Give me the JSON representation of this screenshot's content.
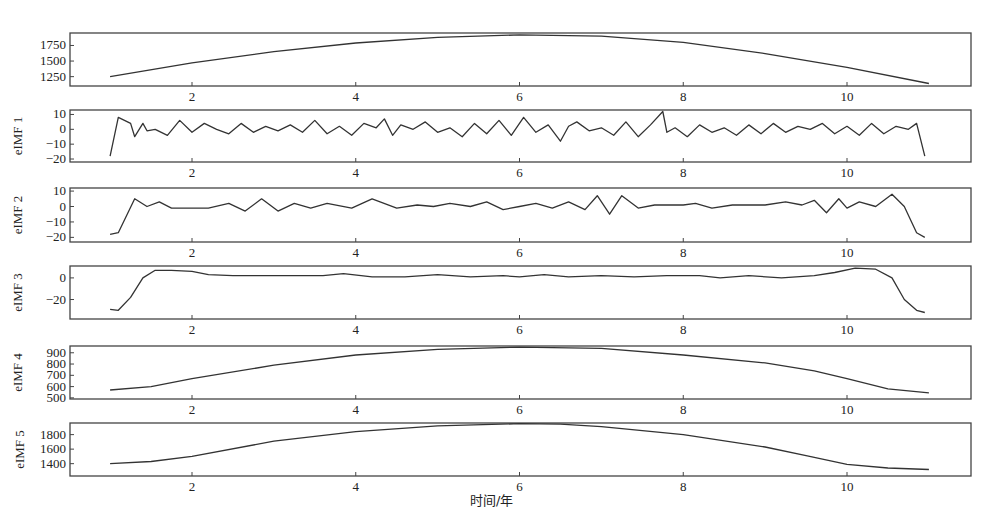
{
  "figure": {
    "xlabel": "时间/年",
    "line_color": "#333333",
    "frame_color": "#444444"
  },
  "chart_data": [
    {
      "type": "line",
      "panel": 0,
      "ylabel": "",
      "xlim": [
        0.3,
        11.5
      ],
      "ylim": [
        1100,
        1950
      ],
      "xticks": [
        2,
        4,
        6,
        8,
        10
      ],
      "yticks": [
        1250,
        1500,
        1750
      ],
      "x": [
        1.0,
        2.0,
        3.0,
        4.0,
        5.0,
        6.0,
        7.0,
        8.0,
        9.0,
        10.0,
        11.0
      ],
      "values": [
        1250,
        1470,
        1650,
        1790,
        1880,
        1920,
        1900,
        1800,
        1620,
        1400,
        1140
      ]
    },
    {
      "type": "line",
      "panel": 1,
      "ylabel": "eIMF 1",
      "xlim": [
        0.3,
        11.5
      ],
      "ylim": [
        -22,
        13
      ],
      "xticks": [
        2,
        4,
        6,
        8,
        10
      ],
      "yticks": [
        -20,
        -10,
        0,
        10
      ],
      "x": [
        1.0,
        1.1,
        1.25,
        1.3,
        1.4,
        1.45,
        1.55,
        1.7,
        1.85,
        2.0,
        2.15,
        2.3,
        2.45,
        2.6,
        2.75,
        2.9,
        3.05,
        3.2,
        3.35,
        3.5,
        3.65,
        3.8,
        3.95,
        4.1,
        4.25,
        4.35,
        4.45,
        4.55,
        4.7,
        4.85,
        5.0,
        5.15,
        5.3,
        5.45,
        5.6,
        5.75,
        5.9,
        6.05,
        6.2,
        6.35,
        6.5,
        6.6,
        6.7,
        6.85,
        7.0,
        7.15,
        7.3,
        7.45,
        7.6,
        7.75,
        7.8,
        7.9,
        8.05,
        8.2,
        8.35,
        8.5,
        8.65,
        8.8,
        8.95,
        9.1,
        9.25,
        9.4,
        9.55,
        9.7,
        9.85,
        10.0,
        10.15,
        10.3,
        10.45,
        10.6,
        10.75,
        10.85,
        10.95
      ],
      "values": [
        -18,
        8,
        4,
        -5,
        4,
        -1,
        0,
        -4,
        6,
        -2,
        4,
        0,
        -3,
        4,
        -2,
        2,
        -1,
        3,
        -2,
        6,
        -3,
        2,
        -4,
        4,
        1,
        7,
        -4,
        3,
        0,
        5,
        -2,
        1,
        -5,
        4,
        -3,
        6,
        -4,
        8,
        -2,
        3,
        -8,
        2,
        5,
        -1,
        1,
        -4,
        5,
        -5,
        3,
        12,
        -2,
        1,
        -5,
        3,
        -2,
        1,
        -4,
        3,
        -3,
        4,
        -2,
        2,
        0,
        4,
        -3,
        2,
        -4,
        4,
        -3,
        2,
        0,
        4,
        -18
      ]
    },
    {
      "type": "line",
      "panel": 2,
      "ylabel": "eIMF 2",
      "xlim": [
        0.3,
        11.5
      ],
      "ylim": [
        -23,
        12
      ],
      "xticks": [
        2,
        4,
        6,
        8,
        10
      ],
      "yticks": [
        -20,
        -10,
        0,
        10
      ],
      "x": [
        1.0,
        1.1,
        1.3,
        1.45,
        1.6,
        1.75,
        2.0,
        2.2,
        2.45,
        2.65,
        2.85,
        3.05,
        3.25,
        3.45,
        3.65,
        3.95,
        4.2,
        4.5,
        4.75,
        4.95,
        5.15,
        5.4,
        5.6,
        5.8,
        6.0,
        6.2,
        6.4,
        6.6,
        6.8,
        6.95,
        7.1,
        7.25,
        7.45,
        7.65,
        8.0,
        8.15,
        8.35,
        8.6,
        8.8,
        9.0,
        9.25,
        9.45,
        9.6,
        9.75,
        9.9,
        10.0,
        10.15,
        10.35,
        10.55,
        10.7,
        10.85,
        10.95
      ],
      "values": [
        -18,
        -17,
        5,
        0,
        3,
        -1,
        -1,
        -1,
        2,
        -3,
        5,
        -3,
        2,
        -1,
        2,
        -1,
        5,
        -1,
        1,
        0,
        2,
        0,
        3,
        -2,
        0,
        2,
        -1,
        3,
        -2,
        7,
        -5,
        7,
        -1,
        1,
        1,
        2,
        -1,
        1,
        1,
        1,
        3,
        1,
        4,
        -4,
        5,
        -1,
        3,
        0,
        8,
        0,
        -17,
        -20
      ]
    },
    {
      "type": "line",
      "panel": 3,
      "ylabel": "eIMF 3",
      "xlim": [
        0.3,
        11.5
      ],
      "ylim": [
        -38,
        11
      ],
      "xticks": [
        2,
        4,
        6,
        8,
        10
      ],
      "yticks": [
        -20,
        0
      ],
      "x": [
        1.0,
        1.1,
        1.25,
        1.4,
        1.55,
        1.75,
        2.0,
        2.2,
        2.5,
        2.8,
        3.2,
        3.6,
        3.85,
        4.2,
        4.6,
        5.0,
        5.4,
        5.8,
        6.0,
        6.3,
        6.6,
        7.0,
        7.4,
        7.8,
        8.2,
        8.45,
        8.8,
        9.2,
        9.6,
        9.85,
        10.1,
        10.35,
        10.55,
        10.7,
        10.85,
        10.95
      ],
      "values": [
        -29,
        -30,
        -18,
        0,
        7,
        7,
        6,
        3,
        2,
        2,
        2,
        2,
        4,
        1,
        1,
        3,
        1,
        2,
        1,
        3,
        1,
        2,
        1,
        2,
        2,
        0,
        2,
        0,
        2,
        5,
        9,
        8,
        0,
        -20,
        -30,
        -32
      ]
    },
    {
      "type": "line",
      "panel": 4,
      "ylabel": "eIMF 4",
      "xlim": [
        0.3,
        11.5
      ],
      "ylim": [
        490,
        960
      ],
      "xticks": [
        2,
        4,
        6,
        8,
        10
      ],
      "yticks": [
        500,
        600,
        700,
        800,
        900
      ],
      "x": [
        1.0,
        1.5,
        2.0,
        3.0,
        4.0,
        5.0,
        6.0,
        7.0,
        8.0,
        9.0,
        9.6,
        10.0,
        10.5,
        11.0
      ],
      "values": [
        570,
        600,
        670,
        790,
        880,
        930,
        950,
        940,
        880,
        810,
        740,
        670,
        580,
        545
      ]
    },
    {
      "type": "line",
      "panel": 5,
      "ylabel": "eIMF 5",
      "xlim": [
        0.3,
        11.5
      ],
      "ylim": [
        1230,
        1960
      ],
      "xticks": [
        2,
        4,
        6,
        8,
        10
      ],
      "yticks": [
        1400,
        1600,
        1800
      ],
      "x": [
        1.0,
        1.5,
        2.0,
        3.0,
        4.0,
        5.0,
        6.0,
        6.5,
        7.0,
        8.0,
        9.0,
        9.5,
        10.0,
        10.5,
        11.0
      ],
      "values": [
        1400,
        1430,
        1500,
        1710,
        1840,
        1920,
        1950,
        1945,
        1910,
        1800,
        1630,
        1510,
        1390,
        1340,
        1320
      ]
    }
  ]
}
